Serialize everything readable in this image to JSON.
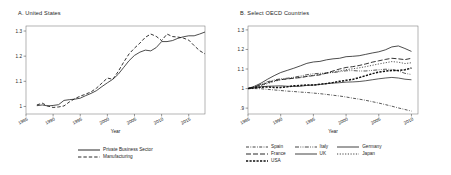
{
  "figure": {
    "panels": [
      {
        "id": "panel-a",
        "title": "A. United States",
        "xlabel": "Year",
        "ylabel": ""
      },
      {
        "id": "panel-b",
        "title": "B. Select OECD Countries",
        "xlabel": "Year",
        "ylabel": ""
      }
    ]
  },
  "chart_data": [
    {
      "type": "line",
      "title": "A. United States",
      "xlabel": "Year",
      "ylabel": "",
      "xlim": [
        1985,
        2018
      ],
      "ylim": [
        0.97,
        1.32
      ],
      "xticks": [
        1985,
        1990,
        1995,
        2000,
        2005,
        2010,
        2015
      ],
      "yticks": [
        1,
        1.1,
        1.2,
        1.3
      ],
      "ytick_labels": [
        "1",
        "1.1",
        "1.2",
        "1.3"
      ],
      "grid": false,
      "legend_position": "below",
      "x": [
        1987,
        1988,
        1989,
        1990,
        1991,
        1992,
        1993,
        1994,
        1995,
        1996,
        1997,
        1998,
        1999,
        2000,
        2001,
        2002,
        2003,
        2004,
        2005,
        2006,
        2007,
        2008,
        2009,
        2010,
        2011,
        2012,
        2013,
        2014,
        2015,
        2016,
        2017,
        2018
      ],
      "series": [
        {
          "name": "Private Business Sector",
          "style": "solid",
          "values": [
            1.003,
            1.006,
            1.002,
            1.004,
            1.007,
            1.024,
            1.027,
            1.029,
            1.033,
            1.043,
            1.052,
            1.063,
            1.079,
            1.094,
            1.108,
            1.128,
            1.155,
            1.182,
            1.203,
            1.216,
            1.224,
            1.221,
            1.234,
            1.258,
            1.258,
            1.262,
            1.271,
            1.277,
            1.281,
            1.281,
            1.288,
            1.296
          ]
        },
        {
          "name": "Manufacturing",
          "style": "dashed",
          "values": [
            1.006,
            1.013,
            1.002,
            0.996,
            0.998,
            1.002,
            1.018,
            1.031,
            1.041,
            1.049,
            1.058,
            1.073,
            1.093,
            1.113,
            1.108,
            1.139,
            1.176,
            1.209,
            1.232,
            1.252,
            1.275,
            1.288,
            1.279,
            1.262,
            1.288,
            1.278,
            1.276,
            1.272,
            1.264,
            1.242,
            1.222,
            1.209
          ]
        }
      ]
    },
    {
      "type": "line",
      "title": "B. Select OECD Countries",
      "xlabel": "Year",
      "ylabel": "",
      "xlim": [
        1985,
        2011
      ],
      "ylim": [
        0.87,
        1.32
      ],
      "xticks": [
        1985,
        1990,
        1995,
        2000,
        2005,
        2010
      ],
      "yticks": [
        0.9,
        1,
        1.1,
        1.2,
        1.3
      ],
      "ytick_labels": [
        ".9",
        "1",
        "1.1",
        "1.2",
        "1.3"
      ],
      "grid": false,
      "legend_position": "below",
      "x": [
        1985,
        1986,
        1987,
        1988,
        1989,
        1990,
        1991,
        1992,
        1993,
        1994,
        1995,
        1996,
        1997,
        1998,
        1999,
        2000,
        2001,
        2002,
        2003,
        2004,
        2005,
        2006,
        2007,
        2008,
        2009,
        2010
      ],
      "series": [
        {
          "name": "Spain",
          "style": "dash-dot",
          "values": [
            1.0,
            1.0,
            0.999,
            0.996,
            0.993,
            0.99,
            0.987,
            0.985,
            0.982,
            0.98,
            0.977,
            0.974,
            0.97,
            0.966,
            0.962,
            0.957,
            0.951,
            0.946,
            0.94,
            0.933,
            0.926,
            0.918,
            0.91,
            0.901,
            0.893,
            0.885
          ]
        },
        {
          "name": "France",
          "style": "long-dash",
          "values": [
            1.0,
            1.008,
            1.018,
            1.03,
            1.04,
            1.046,
            1.049,
            1.053,
            1.056,
            1.062,
            1.066,
            1.07,
            1.079,
            1.09,
            1.1,
            1.108,
            1.112,
            1.118,
            1.126,
            1.135,
            1.142,
            1.149,
            1.155,
            1.152,
            1.148,
            1.155
          ]
        },
        {
          "name": "USA",
          "style": "thick-dash",
          "values": [
            1.0,
            1.004,
            1.007,
            1.008,
            1.006,
            1.006,
            1.009,
            1.014,
            1.016,
            1.018,
            1.018,
            1.022,
            1.026,
            1.031,
            1.037,
            1.042,
            1.047,
            1.056,
            1.066,
            1.076,
            1.084,
            1.089,
            1.093,
            1.092,
            1.096,
            1.105
          ]
        },
        {
          "name": "Italy",
          "style": "dash-dot-dot",
          "values": [
            1.0,
            1.01,
            1.022,
            1.035,
            1.044,
            1.05,
            1.053,
            1.058,
            1.064,
            1.071,
            1.076,
            1.078,
            1.08,
            1.082,
            1.086,
            1.091,
            1.092,
            1.09,
            1.09,
            1.093,
            1.096,
            1.099,
            1.098,
            1.09,
            1.078,
            1.072
          ]
        },
        {
          "name": "UK",
          "style": "solid-thin",
          "values": [
            1.0,
            1.004,
            1.009,
            1.012,
            1.013,
            1.014,
            1.012,
            1.011,
            1.012,
            1.016,
            1.018,
            1.021,
            1.025,
            1.028,
            1.03,
            1.033,
            1.034,
            1.036,
            1.04,
            1.045,
            1.05,
            1.054,
            1.057,
            1.054,
            1.048,
            1.045
          ]
        },
        {
          "name": "Germany",
          "style": "solid",
          "values": [
            1.0,
            1.012,
            1.028,
            1.048,
            1.066,
            1.082,
            1.093,
            1.104,
            1.116,
            1.129,
            1.136,
            1.139,
            1.147,
            1.152,
            1.155,
            1.163,
            1.165,
            1.168,
            1.175,
            1.182,
            1.188,
            1.198,
            1.213,
            1.218,
            1.205,
            1.19
          ]
        },
        {
          "name": "Japan",
          "style": "dotted",
          "values": [
            1.0,
            1.006,
            1.014,
            1.026,
            1.036,
            1.045,
            1.05,
            1.054,
            1.058,
            1.063,
            1.068,
            1.073,
            1.079,
            1.084,
            1.09,
            1.097,
            1.101,
            1.106,
            1.112,
            1.119,
            1.126,
            1.132,
            1.138,
            1.135,
            1.128,
            1.132
          ]
        }
      ]
    }
  ],
  "legends": {
    "panel_a": [
      {
        "label": "Private Business Sector",
        "style": "solid"
      },
      {
        "label": "Manufacturing",
        "style": "dashed"
      }
    ],
    "panel_b_col1": [
      {
        "label": "Spain",
        "style": "dash-dot"
      },
      {
        "label": "France",
        "style": "long-dash"
      },
      {
        "label": "USA",
        "style": "thick-dash"
      }
    ],
    "panel_b_col2": [
      {
        "label": "Italy",
        "style": "dash-dot-dot"
      },
      {
        "label": "UK",
        "style": "solid-thin"
      }
    ],
    "panel_b_col3": [
      {
        "label": "Germany",
        "style": "solid"
      },
      {
        "label": "Japan",
        "style": "dotted"
      }
    ]
  }
}
